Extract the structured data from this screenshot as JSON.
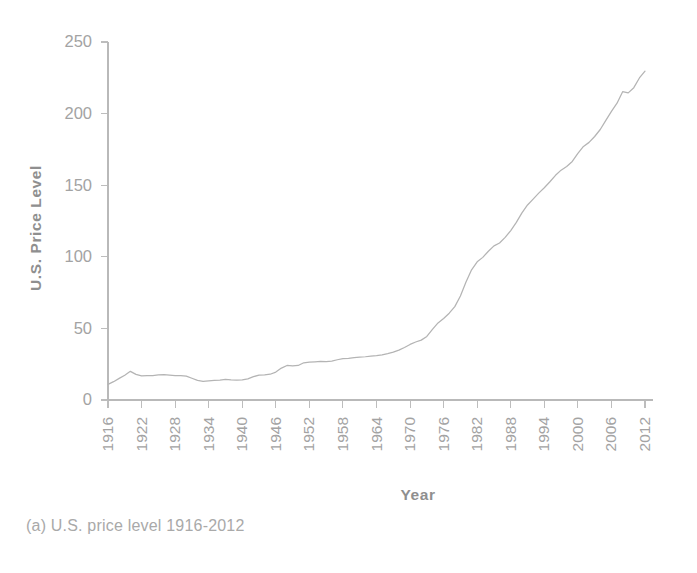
{
  "figure": {
    "caption": "(a) U.S. price level 1916-2012",
    "background_color": "#ffffff",
    "line_color": "#b4b4b4",
    "axis_color": "#bdbdbd",
    "text_color": "#a3a3a3"
  },
  "chart_data": {
    "type": "line",
    "title": "",
    "xlabel": "Year",
    "ylabel": "U.S. Price Level",
    "xlim": [
      1916,
      2012
    ],
    "ylim": [
      0,
      250
    ],
    "grid": false,
    "legend": false,
    "y_ticks": [
      0,
      50,
      100,
      150,
      200,
      250
    ],
    "y_tick_labels": [
      "0",
      "50",
      "100",
      "150",
      "200",
      "250"
    ],
    "x_ticks": [
      1916,
      1922,
      1928,
      1934,
      1940,
      1946,
      1952,
      1958,
      1964,
      1970,
      1976,
      1982,
      1988,
      1994,
      2000,
      2006,
      2012
    ],
    "x_tick_labels": [
      "1916",
      "1922",
      "1928",
      "1934",
      "1940",
      "1946",
      "1952",
      "1958",
      "1964",
      "1970",
      "1976",
      "1982",
      "1988",
      "1994",
      "2000",
      "2006",
      "2012"
    ],
    "x_tick_rotation": 90,
    "series": [
      {
        "name": "U.S. Price Level",
        "x": [
          1916,
          1917,
          1918,
          1919,
          1920,
          1921,
          1922,
          1923,
          1924,
          1925,
          1926,
          1927,
          1928,
          1929,
          1930,
          1931,
          1932,
          1933,
          1934,
          1935,
          1936,
          1937,
          1938,
          1939,
          1940,
          1941,
          1942,
          1943,
          1944,
          1945,
          1946,
          1947,
          1948,
          1949,
          1950,
          1951,
          1952,
          1953,
          1954,
          1955,
          1956,
          1957,
          1958,
          1959,
          1960,
          1961,
          1962,
          1963,
          1964,
          1965,
          1966,
          1967,
          1968,
          1969,
          1970,
          1971,
          1972,
          1973,
          1974,
          1975,
          1976,
          1977,
          1978,
          1979,
          1980,
          1981,
          1982,
          1983,
          1984,
          1985,
          1986,
          1987,
          1988,
          1989,
          1990,
          1991,
          1992,
          1993,
          1994,
          1995,
          1996,
          1997,
          1998,
          1999,
          2000,
          2001,
          2002,
          2003,
          2004,
          2005,
          2006,
          2007,
          2008,
          2009,
          2010,
          2011,
          2012
        ],
        "y": [
          10.9,
          12.8,
          15.1,
          17.3,
          20.0,
          17.9,
          16.8,
          17.1,
          17.1,
          17.5,
          17.7,
          17.4,
          17.1,
          17.1,
          16.7,
          15.2,
          13.7,
          13.0,
          13.4,
          13.7,
          13.9,
          14.4,
          14.1,
          13.9,
          14.0,
          14.7,
          16.3,
          17.3,
          17.6,
          18.0,
          19.5,
          22.3,
          24.1,
          23.8,
          24.1,
          26.0,
          26.5,
          26.7,
          26.9,
          26.8,
          27.2,
          28.1,
          28.9,
          29.1,
          29.6,
          29.9,
          30.2,
          30.6,
          31.0,
          31.5,
          32.4,
          33.4,
          34.8,
          36.7,
          38.8,
          40.5,
          41.8,
          44.4,
          49.3,
          53.8,
          56.9,
          60.6,
          65.2,
          72.6,
          82.4,
          90.9,
          96.5,
          99.6,
          103.9,
          107.6,
          109.6,
          113.6,
          118.3,
          124.0,
          130.7,
          136.2,
          140.3,
          144.5,
          148.2,
          152.4,
          156.9,
          160.5,
          163.0,
          166.6,
          172.2,
          177.1,
          179.9,
          184.0,
          188.9,
          195.3,
          201.6,
          207.3,
          215.3,
          214.5,
          218.1,
          224.9,
          229.6
        ],
        "color": "#b4b4b4",
        "style": "solid"
      }
    ],
    "annotations": [
      {
        "text": "post-WWI peak",
        "year": 1920,
        "value": 20.0
      },
      {
        "text": "Great Depression trough",
        "year": 1933,
        "value": 13.0
      },
      {
        "text": "1970s acceleration",
        "year": 1979,
        "value": 72.6
      },
      {
        "text": "2009 decline",
        "year": 2009,
        "value": 214.5
      }
    ]
  }
}
